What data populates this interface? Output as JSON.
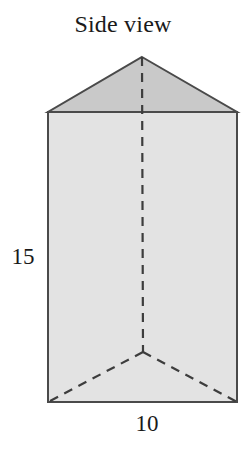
{
  "figure": {
    "title": "Side view",
    "shape_name": "triangular-prism",
    "labels": {
      "height": "15",
      "base": "10"
    },
    "colors": {
      "triangle_fill": "#c9c9c9",
      "rectangle_fill": "#e3e3e3",
      "stroke": "#4a4a4a",
      "dashed_stroke": "#3d3d3d",
      "background": "#ffffff",
      "text": "#1a1a1a"
    },
    "geometry": {
      "apex": [
        142,
        57
      ],
      "top_left": [
        48,
        112
      ],
      "top_right": [
        237,
        112
      ],
      "bottom_left": [
        48,
        402
      ],
      "bottom_right": [
        237,
        402
      ],
      "inner_vertex": [
        143,
        352
      ]
    },
    "edges": {
      "solid": [
        "apex-to-top-left",
        "apex-to-top-right",
        "top-left-to-top-right",
        "top-left-to-bottom-left",
        "top-right-to-bottom-right",
        "bottom-left-to-bottom-right"
      ],
      "dashed": [
        "apex-to-inner-vertex",
        "inner-vertex-to-bottom-left",
        "inner-vertex-to-bottom-right"
      ]
    }
  }
}
